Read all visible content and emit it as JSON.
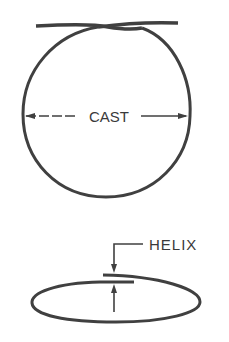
{
  "diagram": {
    "colors": {
      "stroke": "#404040",
      "background": "#ffffff"
    },
    "cast": {
      "label": "CAST",
      "description": "Circular loop with overlapping ends, showing cast diameter"
    },
    "helix": {
      "label": "HELIX",
      "description": "Side view of loop showing vertical offset between overlapping ends"
    }
  }
}
